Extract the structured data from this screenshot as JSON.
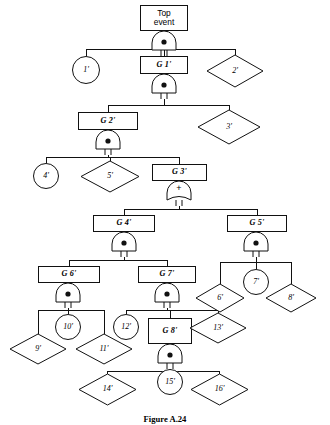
{
  "figure": {
    "caption": "Figure A.24",
    "caption_top": 414
  },
  "diagram": {
    "type": "fault-tree",
    "line_color": "#111111",
    "fill_color": "#ffffff",
    "width": 330,
    "height": 425,
    "nodes": [
      {
        "id": "top",
        "label": "Top\nevent",
        "shape": "box",
        "x": 140,
        "y": 5,
        "w": 48,
        "h": 26
      },
      {
        "id": "g1",
        "label": "G 1'",
        "shape": "box",
        "x": 140,
        "y": 56,
        "w": 48,
        "h": 18
      },
      {
        "id": "n1",
        "label": "1'",
        "shape": "circle",
        "x": 72,
        "y": 56,
        "w": 28,
        "h": 28
      },
      {
        "id": "n2",
        "label": "2'",
        "shape": "diamond",
        "x": 207,
        "y": 55,
        "w": 56,
        "h": 32
      },
      {
        "id": "g2",
        "label": "G 2'",
        "shape": "box",
        "x": 78,
        "y": 112,
        "w": 60,
        "h": 18
      },
      {
        "id": "n3",
        "label": "3'",
        "shape": "diamond",
        "x": 198,
        "y": 110,
        "w": 62,
        "h": 34
      },
      {
        "id": "n4",
        "label": "4'",
        "shape": "circle",
        "x": 33,
        "y": 163,
        "w": 26,
        "h": 26
      },
      {
        "id": "n5",
        "label": "5'",
        "shape": "diamond",
        "x": 81,
        "y": 161,
        "w": 58,
        "h": 31
      },
      {
        "id": "g3",
        "label": "G 3'",
        "shape": "box",
        "x": 152,
        "y": 164,
        "w": 55,
        "h": 17
      },
      {
        "id": "g4",
        "label": "G 4'",
        "shape": "box",
        "x": 93,
        "y": 215,
        "w": 62,
        "h": 17
      },
      {
        "id": "g5",
        "label": "G 5'",
        "shape": "box",
        "x": 227,
        "y": 215,
        "w": 60,
        "h": 17
      },
      {
        "id": "g6",
        "label": "G 6'",
        "shape": "box",
        "x": 38,
        "y": 266,
        "w": 62,
        "h": 17
      },
      {
        "id": "g7",
        "label": "G 7'",
        "shape": "box",
        "x": 138,
        "y": 266,
        "w": 58,
        "h": 17
      },
      {
        "id": "n6",
        "label": "6'",
        "shape": "diamond",
        "x": 196,
        "y": 284,
        "w": 48,
        "h": 28
      },
      {
        "id": "n7",
        "label": "7'",
        "shape": "circle",
        "x": 243,
        "y": 269,
        "w": 26,
        "h": 26
      },
      {
        "id": "n8",
        "label": "8'",
        "shape": "diamond",
        "x": 266,
        "y": 284,
        "w": 50,
        "h": 28
      },
      {
        "id": "n9",
        "label": "9'",
        "shape": "diamond",
        "x": 10,
        "y": 334,
        "w": 56,
        "h": 30
      },
      {
        "id": "n10",
        "label": "10'",
        "shape": "circle",
        "x": 55,
        "y": 314,
        "w": 26,
        "h": 26
      },
      {
        "id": "n11",
        "label": "11'",
        "shape": "diamond",
        "x": 76,
        "y": 334,
        "w": 56,
        "h": 30
      },
      {
        "id": "n12",
        "label": "12'",
        "shape": "circle",
        "x": 113,
        "y": 314,
        "w": 26,
        "h": 26
      },
      {
        "id": "g8",
        "label": "G 8'",
        "shape": "box",
        "x": 148,
        "y": 318,
        "w": 44,
        "h": 26
      },
      {
        "id": "n13",
        "label": "13'",
        "shape": "diamond",
        "x": 190,
        "y": 313,
        "w": 56,
        "h": 30
      },
      {
        "id": "n14",
        "label": "14'",
        "shape": "diamond",
        "x": 79,
        "y": 374,
        "w": 57,
        "h": 31
      },
      {
        "id": "n15",
        "label": "15'",
        "shape": "circle",
        "x": 157,
        "y": 369,
        "w": 26,
        "h": 26
      },
      {
        "id": "n16",
        "label": "16'",
        "shape": "diamond",
        "x": 191,
        "y": 374,
        "w": 57,
        "h": 31
      }
    ],
    "gates": [
      {
        "id": "gate-top",
        "type": "and",
        "symbol": "",
        "parent": "top",
        "x": 152,
        "y": 31,
        "w": 24,
        "h": 25
      },
      {
        "id": "gate-g1",
        "type": "and",
        "symbol": "",
        "parent": "g1",
        "x": 152,
        "y": 74,
        "w": 24,
        "h": 25
      },
      {
        "id": "gate-g2",
        "type": "and",
        "symbol": "",
        "parent": "g2",
        "x": 96,
        "y": 130,
        "w": 24,
        "h": 25
      },
      {
        "id": "gate-g3",
        "type": "or",
        "symbol": "+",
        "parent": "g3",
        "x": 167,
        "y": 181,
        "w": 24,
        "h": 25
      },
      {
        "id": "gate-g4",
        "type": "and",
        "symbol": "",
        "parent": "g4",
        "x": 112,
        "y": 232,
        "w": 24,
        "h": 25
      },
      {
        "id": "gate-g5",
        "type": "and",
        "symbol": "",
        "parent": "g5",
        "x": 244,
        "y": 232,
        "w": 24,
        "h": 25
      },
      {
        "id": "gate-g6",
        "type": "and",
        "symbol": "",
        "parent": "g6",
        "x": 56,
        "y": 283,
        "w": 24,
        "h": 25
      },
      {
        "id": "gate-g7",
        "type": "and",
        "symbol": "",
        "parent": "g7",
        "x": 155,
        "y": 283,
        "w": 24,
        "h": 25
      },
      {
        "id": "gate-g8",
        "type": "and",
        "symbol": "",
        "parent": "g8",
        "x": 158,
        "y": 344,
        "w": 24,
        "h": 25
      }
    ],
    "connections": [
      {
        "gate": "gate-top",
        "bus_y": 49,
        "from_x": 164,
        "children": [
          {
            "x": 86,
            "y": 56
          },
          {
            "x": 164,
            "y": 56
          },
          {
            "x": 235,
            "y": 55
          }
        ]
      },
      {
        "gate": "gate-g1",
        "bus_y": 105,
        "from_x": 164,
        "children": [
          {
            "x": 108,
            "y": 112
          },
          {
            "x": 229,
            "y": 110
          }
        ]
      },
      {
        "gate": "gate-g2",
        "bus_y": 157,
        "from_x": 108,
        "children": [
          {
            "x": 46,
            "y": 163
          },
          {
            "x": 110,
            "y": 161
          },
          {
            "x": 179,
            "y": 164
          }
        ]
      },
      {
        "gate": "gate-g3",
        "bus_y": 209,
        "from_x": 179,
        "children": [
          {
            "x": 124,
            "y": 215
          },
          {
            "x": 257,
            "y": 215
          }
        ]
      },
      {
        "gate": "gate-g4",
        "bus_y": 260,
        "from_x": 124,
        "children": [
          {
            "x": 69,
            "y": 266
          },
          {
            "x": 167,
            "y": 266
          }
        ]
      },
      {
        "gate": "gate-g5",
        "bus_y": 262,
        "from_x": 256,
        "children": [
          {
            "x": 220,
            "y": 284
          },
          {
            "x": 256,
            "y": 269
          },
          {
            "x": 291,
            "y": 284
          }
        ]
      },
      {
        "gate": "gate-g6",
        "bus_y": 310,
        "from_x": 68,
        "children": [
          {
            "x": 38,
            "y": 334
          },
          {
            "x": 68,
            "y": 314
          },
          {
            "x": 104,
            "y": 334
          }
        ]
      },
      {
        "gate": "gate-g7",
        "bus_y": 310,
        "from_x": 167,
        "children": [
          {
            "x": 126,
            "y": 314
          },
          {
            "x": 170,
            "y": 318
          },
          {
            "x": 218,
            "y": 313
          }
        ]
      },
      {
        "gate": "gate-g8",
        "bus_y": 371,
        "from_x": 170,
        "children": [
          {
            "x": 107,
            "y": 374
          },
          {
            "x": 170,
            "y": 369
          },
          {
            "x": 219,
            "y": 374
          }
        ]
      }
    ]
  }
}
